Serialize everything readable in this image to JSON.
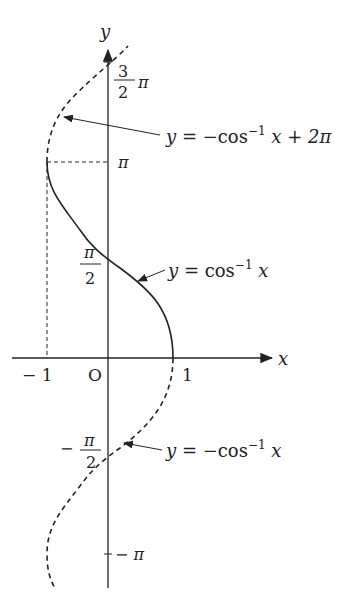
{
  "axes": {
    "x_label": "x",
    "y_label": "y",
    "origin_label": "O",
    "x_ticks": [
      {
        "value": -1,
        "label": "− 1"
      },
      {
        "value": 1,
        "label": "1"
      }
    ],
    "y_ticks": [
      {
        "value": "3π/2",
        "num": "3",
        "den": "2",
        "suffix": "π"
      },
      {
        "value": "π",
        "label": "π"
      },
      {
        "value": "π/2",
        "num": "π",
        "den": "2"
      },
      {
        "value": "-π/2",
        "prefix": "−",
        "num": "π",
        "den": "2"
      },
      {
        "value": "-π",
        "label": "− π"
      }
    ]
  },
  "curves": [
    {
      "name": "arccos",
      "style": "solid",
      "label_y": "y",
      "label_eq": " = cos",
      "label_sup": "−1",
      "label_tail": " x"
    },
    {
      "name": "neg-arccos-plus-2pi",
      "style": "dashed",
      "label_y": "y",
      "label_eq": " = −cos",
      "label_sup": "−1",
      "label_tail": " x + 2π"
    },
    {
      "name": "neg-arccos",
      "style": "dashed",
      "label_y": "y",
      "label_eq": " = −cos",
      "label_sup": "−1",
      "label_tail": " x"
    }
  ],
  "colors": {
    "ink": "#222222",
    "background": "#ffffff"
  }
}
